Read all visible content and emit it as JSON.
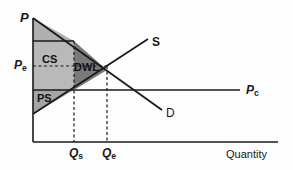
{
  "figure": {
    "type": "supply-demand-welfare-diagram",
    "axes": {
      "y_label": "P",
      "x_label": "Quantity",
      "origin_px": [
        33,
        142
      ],
      "y_axis_top_px": [
        33,
        18
      ],
      "x_axis_right_px": [
        278,
        142
      ]
    },
    "price_ticks": [
      {
        "name": "Pe",
        "base": "P",
        "subscript": "e",
        "y_px": 66
      },
      {
        "name": "Pc",
        "base": "P",
        "subscript": "c",
        "y_px": 90
      }
    ],
    "quantity_ticks": [
      {
        "name": "Qs",
        "base": "Q",
        "subscript": "s",
        "x_px": 74
      },
      {
        "name": "Qe",
        "base": "Q",
        "subscript": "e",
        "x_px": 107
      }
    ],
    "curves": [
      {
        "name": "supply",
        "label": "S",
        "label_px": [
          152,
          42
        ]
      },
      {
        "name": "demand",
        "label": "D",
        "label_px": [
          166,
          113
        ]
      },
      {
        "name": "price-ceiling",
        "label": "Pc",
        "base": "P",
        "subscript": "c",
        "label_px": [
          246,
          91
        ]
      }
    ],
    "regions": [
      {
        "name": "consumer-surplus",
        "label": "CS",
        "label_px": [
          43,
          60
        ],
        "fill": "#b8b8b8"
      },
      {
        "name": "deadweight-loss",
        "label": "DWL",
        "label_px": [
          76,
          68
        ],
        "fill": "#787878"
      },
      {
        "name": "producer-surplus",
        "label": "PS",
        "label_px": [
          38,
          99
        ],
        "fill": "#a3a3a3"
      }
    ],
    "colors": {
      "line": "#1a1a1a",
      "cs_fill": "#b9b9b9",
      "cs_top_fill": "#b0b0b0",
      "dwl_fill": "#7a7a7a",
      "ps_fill": "#a5a5a5",
      "background": "#fdfdfd"
    }
  }
}
